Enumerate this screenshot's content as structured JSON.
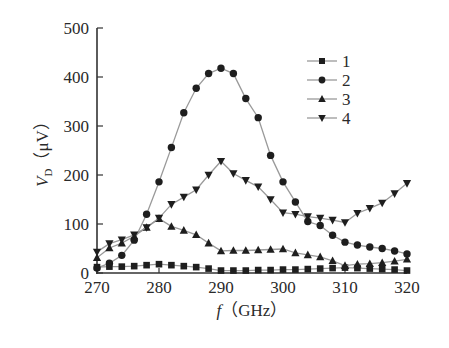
{
  "chart_data": {
    "type": "line",
    "title": "",
    "xlabel_var": "f",
    "xlabel_unit": "（GHz）",
    "ylabel_var": "V",
    "ylabel_sub": "D",
    "ylabel_unit": "（μV）",
    "xlim": [
      270,
      320
    ],
    "ylim": [
      0,
      500
    ],
    "xticks": [
      270,
      280,
      290,
      300,
      310,
      320
    ],
    "yticks": [
      0,
      100,
      200,
      300,
      400,
      500
    ],
    "grid": false,
    "legend_position": "upper right",
    "x": [
      270,
      272,
      274,
      276,
      278,
      280,
      282,
      284,
      286,
      288,
      290,
      292,
      294,
      296,
      298,
      300,
      302,
      304,
      306,
      308,
      310,
      312,
      314,
      316,
      318,
      320
    ],
    "series": [
      {
        "name": "1",
        "marker": "square",
        "values": [
          12,
          13,
          13,
          14,
          16,
          18,
          16,
          14,
          12,
          9,
          5,
          5,
          5,
          6,
          6,
          7,
          7,
          8,
          9,
          10,
          11,
          10,
          9,
          8,
          7,
          5
        ]
      },
      {
        "name": "2",
        "marker": "circle",
        "values": [
          10,
          20,
          36,
          67,
          120,
          186,
          256,
          327,
          377,
          407,
          418,
          407,
          356,
          317,
          240,
          186,
          145,
          105,
          97,
          77,
          63,
          57,
          53,
          50,
          45,
          39
        ]
      },
      {
        "name": "3",
        "marker": "triangle-up",
        "values": [
          31,
          51,
          61,
          75,
          93,
          111,
          95,
          87,
          78,
          61,
          45,
          46,
          46,
          47,
          48,
          49,
          41,
          37,
          33,
          25,
          15,
          18,
          19,
          21,
          24,
          28
        ]
      },
      {
        "name": "4",
        "marker": "triangle-down",
        "values": [
          43,
          60,
          68,
          78,
          93,
          112,
          140,
          155,
          170,
          200,
          228,
          203,
          189,
          176,
          150,
          123,
          120,
          115,
          112,
          108,
          103,
          122,
          132,
          143,
          162,
          183
        ]
      }
    ]
  },
  "style": {
    "line_color": "#9a9a9a",
    "marker_color": "#1e1e1e",
    "axis_color": "#333333"
  }
}
